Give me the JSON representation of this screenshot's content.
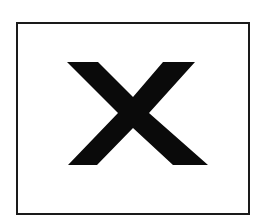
{
  "symbol": {
    "icon": "close-icon",
    "glyph": "X",
    "color": "#0a0a0a",
    "frame_color": "#1a1a1a",
    "background": "#ffffff"
  }
}
